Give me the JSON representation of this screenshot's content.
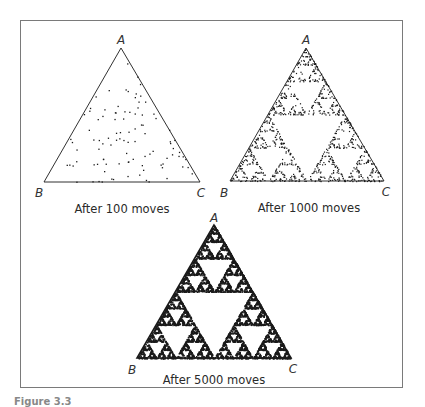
{
  "figure": {
    "caption_label": "Figure 3.3",
    "panels": [
      {
        "id": "panel-100",
        "vertices": {
          "top": "A",
          "left": "B",
          "right": "C"
        },
        "caption": "After 100 moves",
        "moves": 100,
        "render_style": "sparse-random-points"
      },
      {
        "id": "panel-1000",
        "vertices": {
          "top": "A",
          "left": "B",
          "right": "C"
        },
        "caption": "After 1000 moves",
        "moves": 1000,
        "render_style": "emerging-sierpinski-points"
      },
      {
        "id": "panel-5000",
        "vertices": {
          "top": "A",
          "left": "B",
          "right": "C"
        },
        "caption": "After 5000 moves",
        "moves": 5000,
        "render_style": "dense-sierpinski-gasket"
      }
    ]
  },
  "colors": {
    "ink": "#1a1a1a",
    "frame": "#7a7a7a",
    "background": "#ffffff"
  }
}
